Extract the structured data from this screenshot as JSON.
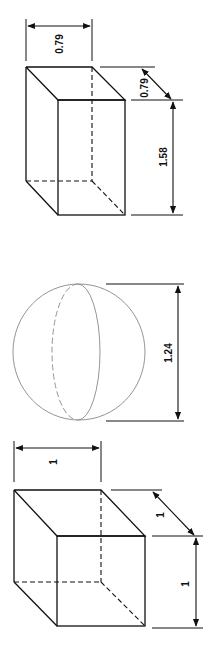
{
  "figure": {
    "shapes": [
      {
        "id": "rectangular-prism",
        "type": "rectangular prism",
        "dimensions": {
          "width": "0.79",
          "depth": "0.79",
          "height": "1.58"
        }
      },
      {
        "id": "sphere",
        "type": "sphere",
        "dimensions": {
          "diameter": "1.24"
        }
      },
      {
        "id": "cube",
        "type": "cube",
        "dimensions": {
          "width": "1",
          "depth": "1",
          "height": "1"
        }
      }
    ]
  },
  "labels": {
    "prism_width": "0.79",
    "prism_depth": "0.79",
    "prism_height": "1.58",
    "sphere_diameter": "1.24",
    "cube_width": "1",
    "cube_depth": "1",
    "cube_height": "1"
  }
}
